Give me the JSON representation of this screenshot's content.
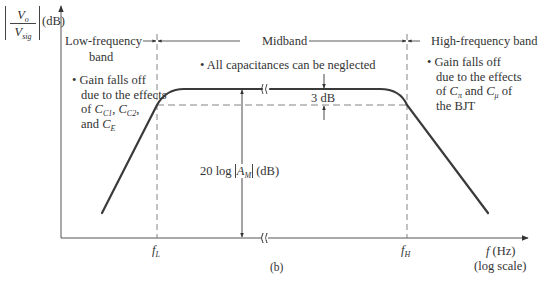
{
  "figure": {
    "caption": "(b)",
    "y_axis": {
      "label_numerator": "V",
      "label_numerator_sub": "o",
      "label_denominator": "V",
      "label_denominator_sub": "sig",
      "label_unit": "(dB)"
    },
    "x_axis": {
      "label": "f",
      "label_unit": "(Hz)",
      "label_scale": "(log scale)",
      "ticks": [
        {
          "label": "f",
          "sub": "L"
        },
        {
          "label": "f",
          "sub": "H"
        }
      ]
    },
    "bands": {
      "low": {
        "title_line1": "Low-frequency",
        "title_line2": "band",
        "note_line1": "• Gain falls off",
        "note_line2": "due to the effects",
        "note_line3_prefix": "of ",
        "note_cap1": "C",
        "note_cap1_sub": "C1",
        "note_sep1": ", ",
        "note_cap2": "C",
        "note_cap2_sub": "C2",
        "note_sep2": ",",
        "note_line4_prefix": "and ",
        "note_cap3": "C",
        "note_cap3_sub": "E"
      },
      "mid": {
        "title": "Midband",
        "note": "• All capacitances can be neglected",
        "gain_prefix": "20 log ",
        "gain_var": "A",
        "gain_sub": "M",
        "gain_unit": "(dB)",
        "drop_label": "3 dB"
      },
      "high": {
        "title": "High-frequency band",
        "note_line1": "• Gain falls off",
        "note_line2": "due to the effects",
        "note_line3_prefix": "of ",
        "note_cap1": "C",
        "note_cap1_sub": "π",
        "note_mid": " and ",
        "note_cap2": "C",
        "note_cap2_sub": "μ",
        "note_line3_suffix": " of",
        "note_line4": "the BJT"
      }
    },
    "colors": {
      "curve": "#3a3a3a",
      "axis": "#555555",
      "dashed": "#777777",
      "text": "#333333"
    }
  }
}
